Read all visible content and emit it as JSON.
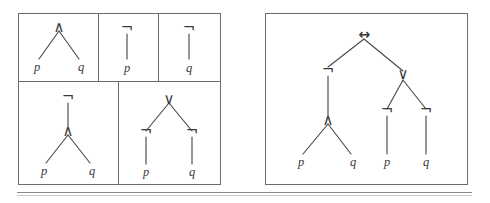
{
  "figure": {
    "caption": "",
    "kind": "syntax-tree-figure",
    "colors": {
      "background": "#ffffff",
      "border": "#6b6b6b",
      "edge": "#4a4a4a",
      "text": "#3a3a3a",
      "rule": "#8a8a8a"
    }
  },
  "symbols": {
    "and": "∧",
    "or": "∨",
    "not": "¬",
    "iff": "↔",
    "p": "p",
    "q": "q"
  },
  "left_panel": {
    "name": "component-trees-grid",
    "rows": 2,
    "cells": [
      {
        "id": "cell-and",
        "formula": "p ∧ q",
        "root": "∧",
        "leaves": [
          "p",
          "q"
        ]
      },
      {
        "id": "cell-not-p",
        "formula": "¬p",
        "root": "¬",
        "leaves": [
          "p"
        ]
      },
      {
        "id": "cell-not-q",
        "formula": "¬q",
        "root": "¬",
        "leaves": [
          "q"
        ]
      },
      {
        "id": "cell-not-and",
        "formula": "¬(p ∧ q)",
        "root": "¬",
        "second": "∧",
        "leaves": [
          "p",
          "q"
        ]
      },
      {
        "id": "cell-or-of-nots",
        "formula": "¬p ∨ ¬q",
        "root": "∨",
        "second_left": "¬",
        "second_right": "¬",
        "leaves": [
          "p",
          "q"
        ]
      }
    ]
  },
  "right_panel": {
    "name": "full-biconditional-tree",
    "formula": "¬(p ∧ q) ↔ (¬p ∨ ¬q)",
    "root": "↔",
    "left_subtree": {
      "root": "¬",
      "child": "∧",
      "leaves": [
        "p",
        "q"
      ]
    },
    "right_subtree": {
      "root": "∨",
      "left_child": "¬",
      "right_child": "¬",
      "leaves": [
        "p",
        "q"
      ]
    }
  }
}
